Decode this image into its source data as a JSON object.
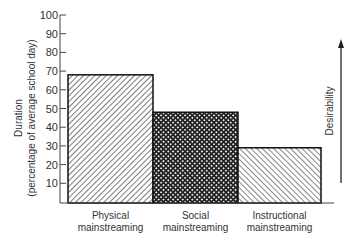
{
  "chart_data": {
    "type": "bar",
    "title": "",
    "categories": [
      "Physical mainstreaming",
      "Social mainstreaming",
      "Instructional mainstreaming"
    ],
    "category_lines": [
      [
        "Physical",
        "mainstreaming"
      ],
      [
        "Social",
        "mainstreaming"
      ],
      [
        "Instructional",
        "mainstreaming"
      ]
    ],
    "values": [
      68,
      48,
      29
    ],
    "patterns": [
      "diagonal-hatch-forward",
      "crosshatch",
      "diagonal-hatch-backward"
    ],
    "xlabel": "",
    "ylabel": "Duration",
    "ylabel_sub": "(percentage of average school day)",
    "ylim": [
      0,
      100
    ],
    "yticks": [
      10,
      20,
      30,
      40,
      50,
      60,
      70,
      80,
      90,
      100
    ],
    "grid": false,
    "annotation": {
      "text": "Desirability",
      "type": "upward-arrow"
    }
  }
}
